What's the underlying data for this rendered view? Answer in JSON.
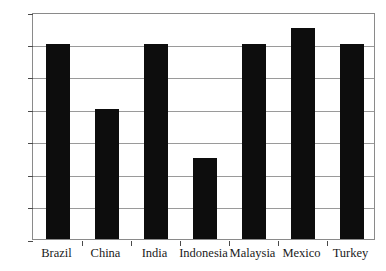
{
  "chart_data": {
    "type": "bar",
    "title": "",
    "xlabel": "",
    "ylabel": "",
    "categories": [
      "Brazil",
      "China",
      "India",
      "Indonesia",
      "Malaysia",
      "Mexico",
      "Turkey"
    ],
    "values": [
      96,
      92,
      96,
      89,
      96,
      97,
      96
    ],
    "ylim": [
      84,
      98
    ],
    "ytick_step": 2,
    "yticks": [
      84,
      86,
      88,
      90,
      92,
      94,
      96,
      98
    ],
    "ytick_labels": [
      "84",
      "86",
      "88",
      "90",
      "92",
      "94",
      "96",
      "98"
    ],
    "grid": true,
    "grid_axis": "y",
    "legend": false,
    "legend_position": "none",
    "bar_color": "#0d0d0d",
    "grid_color": "#9a9a9a",
    "axis_color": "#8a8a8a",
    "background_color": "#ffffff",
    "series": [
      {
        "name": "",
        "values": [
          96,
          92,
          96,
          89,
          96,
          97,
          96
        ]
      }
    ]
  },
  "cropped_title_fragment": "' '"
}
